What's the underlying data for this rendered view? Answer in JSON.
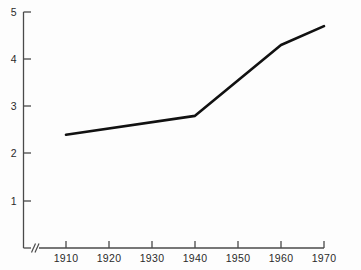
{
  "chart_data": {
    "type": "line",
    "title": "",
    "subtitle": "",
    "xlabel": "",
    "ylabel": "",
    "x": [
      1910,
      1940,
      1960,
      1970
    ],
    "values": [
      2.4,
      2.8,
      4.3,
      4.7
    ],
    "series": [
      {
        "name": "",
        "x": [
          1910,
          1940,
          1960,
          1970
        ],
        "values": [
          2.4,
          2.8,
          4.3,
          4.7
        ]
      }
    ],
    "xlim": [
      1910,
      1970
    ],
    "ylim": [
      0,
      5
    ],
    "x_tick_labels": [
      "1910",
      "1920",
      "1930",
      "1940",
      "1950",
      "1960",
      "1970"
    ],
    "x_ticks": [
      1910,
      1920,
      1930,
      1940,
      1950,
      1960,
      1970
    ],
    "y_tick_labels": [
      "1",
      "2",
      "3",
      "4",
      "5"
    ],
    "y_ticks": [
      1,
      2,
      3,
      4,
      5
    ],
    "grid": false,
    "legend": null,
    "legend_position": "none",
    "annotations": [],
    "axis_break": {
      "axis": "x",
      "symbol": "//",
      "note": "double-slash break mark on x-axis just right of origin"
    },
    "colors": {
      "background": "#fdfdfd",
      "axis": "#4a4a4a",
      "line": "#111111",
      "text": "#2b2b2b"
    },
    "line_width": 2.6
  },
  "axes": {
    "x_axis_name": "x-axis",
    "y_axis_name": "y-axis"
  }
}
